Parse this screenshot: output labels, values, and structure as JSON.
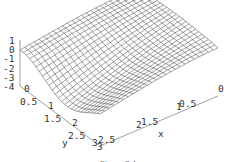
{
  "chart_data": {
    "type": "surface3d",
    "title": "",
    "xlabel": "x",
    "ylabel": "y",
    "zlabel": "",
    "x_range": [
      0,
      3
    ],
    "y_range": [
      0,
      3
    ],
    "z_range": [
      -4,
      1
    ],
    "x_ticks": [
      "0",
      "0.5",
      "1",
      "1.5",
      "2",
      "2.5",
      "3"
    ],
    "y_ticks": [
      "0",
      "0.5",
      "1",
      "1.5",
      "2",
      "2.5",
      "3"
    ],
    "z_ticks": [
      "1",
      "0",
      "-1",
      "-2",
      "-3",
      "-4"
    ],
    "mesh": "wireframe",
    "grid_divisions": 25
  },
  "caption": "Figure 7.4"
}
